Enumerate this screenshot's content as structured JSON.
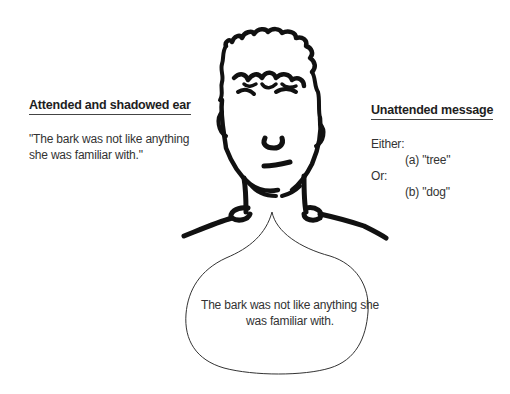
{
  "left_panel": {
    "heading": "Attended and shadowed ear",
    "quote_line1": "\"The bark was not like anything",
    "quote_line2": "she was familiar with.\""
  },
  "right_panel": {
    "heading": "Unattended message",
    "either_label": "Either:",
    "option_a": "(a)  \"tree\"",
    "or_label": "Or:",
    "option_b": "(b)  \"dog\""
  },
  "thought_bubble": {
    "line1": "The bark was not like anything she",
    "line2": "was familiar with."
  },
  "figure": {
    "stroke_color": "#111111"
  }
}
